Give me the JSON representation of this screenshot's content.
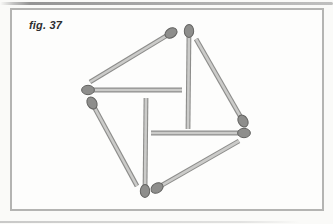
{
  "figure": {
    "label": "fig. 37"
  },
  "colors": {
    "background": "#fafaf8",
    "panel_background": "#fdfdfc",
    "panel_border": "#b4b4b2",
    "stick_fill": "#cbcbc9",
    "stick_edge": "#8d8d8b",
    "head_fill": "#8e8e8c",
    "head_edge": "#646462",
    "label_text": "#2e2e2e"
  },
  "style": {
    "stick_outer_width": 4.8,
    "stick_inner_width": 2.6,
    "head_rx": 6.4,
    "head_ry": 4.7
  },
  "matches": [
    {
      "name": "outer-top-left-side",
      "tail": [
        90,
        82
      ],
      "head": [
        171,
        33
      ]
    },
    {
      "name": "outer-top-right-side",
      "tail": [
        196,
        39
      ],
      "head": [
        243,
        121
      ]
    },
    {
      "name": "outer-bottom-right-side",
      "tail": [
        239,
        141
      ],
      "head": [
        157,
        188
      ]
    },
    {
      "name": "outer-bottom-left-side",
      "tail": [
        137,
        186
      ],
      "head": [
        92,
        103
      ]
    },
    {
      "name": "inner-vertical-top",
      "tail": [
        188,
        129
      ],
      "head": [
        189,
        31
      ]
    },
    {
      "name": "inner-horizontal-right",
      "tail": [
        151,
        133
      ],
      "head": [
        244,
        133
      ]
    },
    {
      "name": "inner-vertical-bottom",
      "tail": [
        146,
        98
      ],
      "head": [
        145,
        191
      ]
    },
    {
      "name": "inner-horizontal-left",
      "tail": [
        182,
        90
      ],
      "head": [
        88,
        90
      ]
    }
  ]
}
